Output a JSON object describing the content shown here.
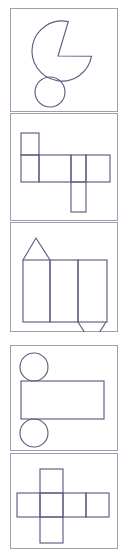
{
  "document": {
    "title": "Geometric Nets and Solids Worksheet Strip",
    "description": "Vertical strip of five bordered panels, each containing a line drawing of a geometric figure or net",
    "page_width": 128,
    "page_height": 553,
    "background_color": "#ffffff",
    "frame_color": "#9aa0b4",
    "line_color": "#5a5f80",
    "panel_count": 5
  },
  "panels": [
    {
      "index": 1,
      "name": "circle-with-wedge-cut-and-small-circle",
      "label": "Pac-man style circle with wedge notch plus small circle below",
      "top": 8,
      "height": 104,
      "frame": {
        "x": 10,
        "y": 8,
        "width": 108,
        "height": 104
      },
      "shapes": [
        {
          "kind": "circle-sector-cut",
          "name": "large-circle-with-notch",
          "cx": 62,
          "cy": 51,
          "r": 30,
          "notch_start_angle_deg": -78,
          "notch_end_angle_deg": 10,
          "notch_apex_x": 58,
          "notch_apex_y": 56
        },
        {
          "kind": "circle",
          "name": "small-circle",
          "cx": 50,
          "cy": 92,
          "r": 15
        }
      ]
    },
    {
      "index": 2,
      "name": "box-net-rectangles",
      "label": "Net of a rectangular box made of joined rectangles",
      "top": 113,
      "height": 108,
      "frame": {
        "x": 10,
        "y": 113,
        "width": 108,
        "height": 108
      },
      "shapes": [
        {
          "kind": "rect",
          "name": "net-cell-top-left",
          "x": 21,
          "y": 133,
          "width": 18,
          "height": 22
        },
        {
          "kind": "rect",
          "name": "net-cell-mid-left",
          "x": 21,
          "y": 155,
          "width": 18,
          "height": 27
        },
        {
          "kind": "rect",
          "name": "net-cell-mid-center",
          "x": 39,
          "y": 155,
          "width": 32,
          "height": 27
        },
        {
          "kind": "rect",
          "name": "net-cell-mid-right-a",
          "x": 71,
          "y": 155,
          "width": 15,
          "height": 27
        },
        {
          "kind": "rect",
          "name": "net-cell-mid-right-b",
          "x": 86,
          "y": 155,
          "width": 24,
          "height": 27
        },
        {
          "kind": "rect",
          "name": "net-cell-bottom-tab",
          "x": 71,
          "y": 182,
          "width": 15,
          "height": 30
        }
      ]
    },
    {
      "index": 3,
      "name": "triangular-prism-net",
      "label": "Net of a triangular prism: three rectangles with a triangle on top and a triangle below",
      "top": 222,
      "height": 110,
      "frame": {
        "x": 10,
        "y": 222,
        "width": 108,
        "height": 110
      },
      "shapes": [
        {
          "kind": "triangle",
          "name": "top-triangle",
          "points": "23,260 36,238 50,260"
        },
        {
          "kind": "rect",
          "name": "prism-face-left",
          "x": 23,
          "y": 260,
          "width": 27,
          "height": 62
        },
        {
          "kind": "rect",
          "name": "prism-face-center",
          "x": 50,
          "y": 260,
          "width": 28,
          "height": 62
        },
        {
          "kind": "rect",
          "name": "prism-face-right",
          "x": 78,
          "y": 260,
          "width": 29,
          "height": 62
        },
        {
          "kind": "triangle",
          "name": "bottom-triangle",
          "points": "78,322 92,344 106,322"
        }
      ]
    },
    {
      "index": 4,
      "name": "cylinder-net",
      "label": "Net of a cylinder: two circles and one rectangle",
      "top": 345,
      "height": 106,
      "frame": {
        "x": 10,
        "y": 345,
        "width": 108,
        "height": 106
      },
      "shapes": [
        {
          "kind": "circle",
          "name": "cylinder-top-circle",
          "cx": 34,
          "cy": 367,
          "r": 14
        },
        {
          "kind": "rect",
          "name": "cylinder-body-rect",
          "x": 21,
          "y": 381,
          "width": 83,
          "height": 38
        },
        {
          "kind": "circle",
          "name": "cylinder-bottom-circle",
          "cx": 34,
          "cy": 433,
          "r": 14
        }
      ]
    },
    {
      "index": 5,
      "name": "cube-net-cross",
      "label": "Cross shaped cube net of six squares",
      "top": 453,
      "height": 96,
      "frame": {
        "x": 10,
        "y": 453,
        "width": 108,
        "height": 96
      },
      "shapes": [
        {
          "kind": "rect",
          "name": "cross-cell-top",
          "x": 40,
          "y": 469,
          "width": 23,
          "height": 24
        },
        {
          "kind": "rect",
          "name": "cross-cell-left",
          "x": 17,
          "y": 493,
          "width": 23,
          "height": 24
        },
        {
          "kind": "rect",
          "name": "cross-cell-center",
          "x": 40,
          "y": 493,
          "width": 23,
          "height": 24
        },
        {
          "kind": "rect",
          "name": "cross-cell-right-a",
          "x": 63,
          "y": 493,
          "width": 23,
          "height": 24
        },
        {
          "kind": "rect",
          "name": "cross-cell-right-b",
          "x": 86,
          "y": 493,
          "width": 23,
          "height": 24
        },
        {
          "kind": "rect",
          "name": "cross-cell-bottom",
          "x": 40,
          "y": 517,
          "width": 23,
          "height": 26
        }
      ]
    }
  ]
}
